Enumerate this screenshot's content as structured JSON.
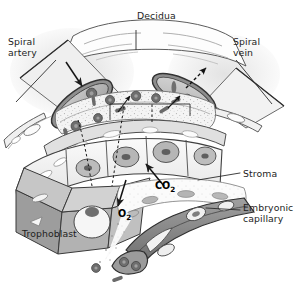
{
  "figure": {
    "width": 302,
    "height": 284,
    "background": "#ffffff"
  },
  "labels": {
    "decidua": "Decidua",
    "spiral_artery": "Spiral\nartery",
    "spiral_vein": "Spiral\nvein",
    "stroma": "Stroma",
    "embryonic_capillary": "Embryonic\ncapillary",
    "trophoblast": "Trophoblast"
  },
  "gas_annotations": {
    "co2": "CO",
    "co2_sub": "2",
    "o2": "O",
    "o2_sub": "2"
  },
  "colors": {
    "ink": "#1d1d1d",
    "outline": "#3a3a3a",
    "decidua_fill": "#fdfdfd",
    "vessel_wall": "#8d8d8d",
    "vessel_lumen": "#b9b9b9",
    "trophoblast_face": "#f1f1f1",
    "trophoblast_side": "#9a9a9a",
    "trophoblast_top": "#c9c9c9",
    "stroma_fill": "#efefef",
    "capillary_fill": "#8a8a8a",
    "capillary_dark": "#6f6f6f",
    "rbc": "#6e6e6e",
    "nucleus": "#9f9f9f",
    "leader": "#4a4a4a",
    "glow": "#e9e9e9"
  },
  "structures": [
    {
      "name": "decidua",
      "description": "maternal decidual tissue band across top"
    },
    {
      "name": "spiral-artery",
      "description": "maternal spiral artery entering from upper left, solid arrow shows inflow"
    },
    {
      "name": "spiral-vein",
      "description": "maternal spiral vein exiting to upper right, dashed arrow shows outflow"
    },
    {
      "name": "intervillous-space",
      "description": "maternal blood space with free red blood cells"
    },
    {
      "name": "trophoblast-layer",
      "description": "row of cuboidal trophoblast cells with nuclei, shown as 3D cutaway blocks"
    },
    {
      "name": "stroma",
      "description": "villous core connective tissue, stippled"
    },
    {
      "name": "embryonic-capillary",
      "description": "fetal capillary running bottom right with endothelial nuclei"
    },
    {
      "name": "gas-exchange",
      "description": "O2 diffuses toward fetal capillary, CO2 diffuses toward maternal blood"
    }
  ]
}
